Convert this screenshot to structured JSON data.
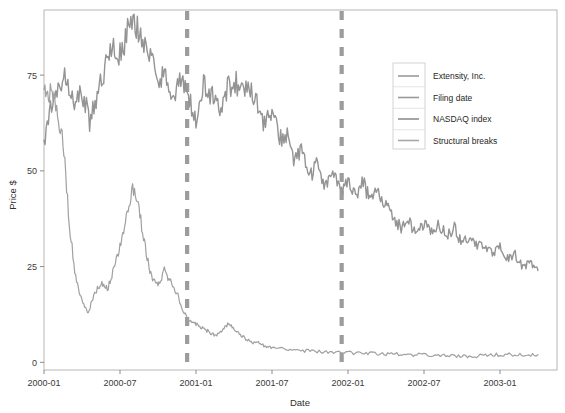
{
  "chart_data": {
    "type": "line",
    "title": "",
    "xlabel": "Date",
    "ylabel": "Price $",
    "grid": false,
    "legend_position": "top-right",
    "xtick_labels": [
      "2000-01",
      "2000-07",
      "2001-01",
      "2001-07",
      "2002-01",
      "2002-07",
      "2003-01"
    ],
    "ytick_labels": [
      "0",
      "25",
      "50",
      "75"
    ],
    "ytick_values": [
      0,
      25,
      50,
      75
    ],
    "ylim": [
      -2,
      92
    ],
    "xlim": [
      "2000-01",
      "2003-04"
    ],
    "legend": [
      {
        "name": "Extensity, Inc.",
        "color": "#9a9a9a"
      },
      {
        "name": "Filing date",
        "color": "#9a9a9a"
      },
      {
        "name": "NASDAQ index",
        "color": "#8f8f8f"
      },
      {
        "name": "Structural breaks",
        "color": "#a8a8a8"
      }
    ],
    "series": [
      {
        "name": "NASDAQ index",
        "color": "#949494",
        "style": "solid",
        "width": 1.4,
        "x": [
          0,
          0.6,
          1.2,
          1.8,
          2.4,
          3,
          3.6,
          4.2,
          4.8,
          5.4,
          6,
          6.6,
          7.2,
          7.8,
          8.4,
          9,
          9.6,
          10.2,
          10.8,
          11.4,
          12,
          12.6,
          13.2,
          13.8,
          14.4,
          15,
          15.6,
          16.2,
          16.8,
          17.4,
          18,
          18.6,
          19.2,
          19.8,
          20.4,
          21,
          21.6,
          22.2,
          22.8,
          23.4,
          24,
          24.6,
          25.2,
          25.8,
          26.4,
          27,
          27.6,
          28.2,
          28.8,
          29.4,
          30,
          30.6,
          31.2,
          31.8,
          32.4,
          33,
          33.6,
          34.2,
          34.8,
          35.4,
          36,
          36.6,
          37.2,
          37.8,
          38.4,
          39
        ],
        "y": [
          58,
          68,
          72,
          75,
          66,
          71,
          63,
          70,
          77,
          82,
          80,
          86,
          89,
          84,
          80,
          72,
          77,
          68,
          74,
          69,
          63,
          72,
          70,
          66,
          71,
          74,
          70,
          73,
          68,
          62,
          66,
          58,
          60,
          52,
          56,
          48,
          52,
          46,
          50,
          44,
          48,
          44,
          47,
          42,
          45,
          41,
          38,
          35,
          37,
          33,
          36,
          34,
          36,
          33,
          35,
          31,
          33,
          30,
          31,
          28,
          30,
          27,
          28,
          25,
          26,
          24
        ]
      },
      {
        "name": "Extensity, Inc.",
        "color": "#a0a0a0",
        "style": "solid",
        "width": 1.2,
        "x": [
          0,
          0.5,
          1,
          1.5,
          2,
          2.5,
          3,
          3.5,
          4,
          4.5,
          5,
          5.5,
          6,
          6.5,
          7,
          7.5,
          8,
          8.5,
          9,
          9.5,
          10,
          10.5,
          11,
          11.5,
          12,
          12.5,
          13,
          13.5,
          14,
          14.5,
          15,
          15.5,
          16,
          16.5,
          17,
          17.5,
          18,
          19,
          20,
          21,
          22,
          23,
          24,
          25,
          26,
          27,
          28,
          29,
          30,
          31,
          32,
          33,
          34,
          35,
          36,
          37,
          38,
          39
        ],
        "y": [
          72,
          70,
          66,
          58,
          36,
          22,
          16,
          13,
          18,
          21,
          19,
          24,
          30,
          38,
          45,
          40,
          30,
          22,
          20,
          24,
          21,
          18,
          13,
          11,
          10,
          9,
          8,
          7,
          8,
          10,
          9,
          7,
          6,
          5,
          5,
          4,
          4,
          3.5,
          3,
          3,
          2.8,
          2.6,
          2.5,
          2.4,
          2.3,
          2.2,
          2.1,
          2,
          1.9,
          1.8,
          1.7,
          1.6,
          1.6,
          2,
          2,
          2,
          2,
          2
        ]
      }
    ],
    "vertical_lines": [
      {
        "name": "Filing date",
        "label": "2000-12",
        "x": 11.3,
        "color": "#9c9c9c",
        "style": "dashed"
      },
      {
        "name": "Structural break",
        "label": "2001-12",
        "x": 23.5,
        "color": "#9c9c9c",
        "style": "dashed"
      }
    ]
  }
}
